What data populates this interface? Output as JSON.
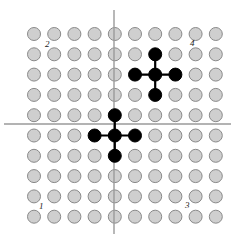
{
  "figure": {
    "width": 235,
    "height": 242,
    "background_color": "#ffffff"
  },
  "colors": {
    "grid_dot_fill": "#cfcfcf",
    "grid_dot_stroke": "#8a8a8a",
    "marked_dot_fill": "#000000",
    "axis_stroke": "#9a9a9a",
    "connector_stroke": "#000000",
    "label_color": "#1a1a1a"
  },
  "chart_data": {
    "type": "scatter",
    "xlabel": "",
    "ylabel": "",
    "grid": false,
    "legend_position": "none",
    "axis_style": "cartesian-cross",
    "grid_columns": 10,
    "grid_rows": 10,
    "dot_diameter": 13,
    "col_spacing": 20.2,
    "row_spacing": 20.3,
    "origin_x": 114,
    "origin_y": 124,
    "first_col_center_x": 34,
    "first_row_center_y": 34,
    "axes": [
      {
        "name": "vertical-axis",
        "orientation": "vertical",
        "position": 114,
        "start": 10,
        "end": 234
      },
      {
        "name": "horizontal-axis",
        "orientation": "horizontal",
        "position": 124,
        "start": 4,
        "end": 231
      }
    ],
    "quadrant_labels": [
      {
        "name": "quadrant-label-2",
        "text": "2",
        "quadrant": "top-left",
        "x": 45,
        "y": 47
      },
      {
        "name": "quadrant-label-4",
        "text": "4",
        "quadrant": "top-right",
        "x": 190,
        "y": 46
      },
      {
        "name": "quadrant-label-1",
        "text": "1",
        "quadrant": "bottom-left",
        "x": 39,
        "y": 209
      },
      {
        "name": "quadrant-label-3",
        "text": "3",
        "quadrant": "bottom-right",
        "x": 185,
        "y": 208
      }
    ],
    "marked_clusters": [
      {
        "name": "upper-right-cluster",
        "shape": "plus",
        "center": {
          "col": 6,
          "row": 2
        },
        "cells": [
          {
            "col": 6,
            "row": 1
          },
          {
            "col": 5,
            "row": 2
          },
          {
            "col": 6,
            "row": 2
          },
          {
            "col": 7,
            "row": 2
          },
          {
            "col": 6,
            "row": 3
          }
        ]
      },
      {
        "name": "origin-cluster",
        "shape": "plus",
        "center": {
          "col": 4,
          "row": 5
        },
        "cells": [
          {
            "col": 4,
            "row": 4
          },
          {
            "col": 3,
            "row": 5
          },
          {
            "col": 4,
            "row": 5
          },
          {
            "col": 5,
            "row": 5
          },
          {
            "col": 4,
            "row": 6
          }
        ]
      }
    ]
  }
}
